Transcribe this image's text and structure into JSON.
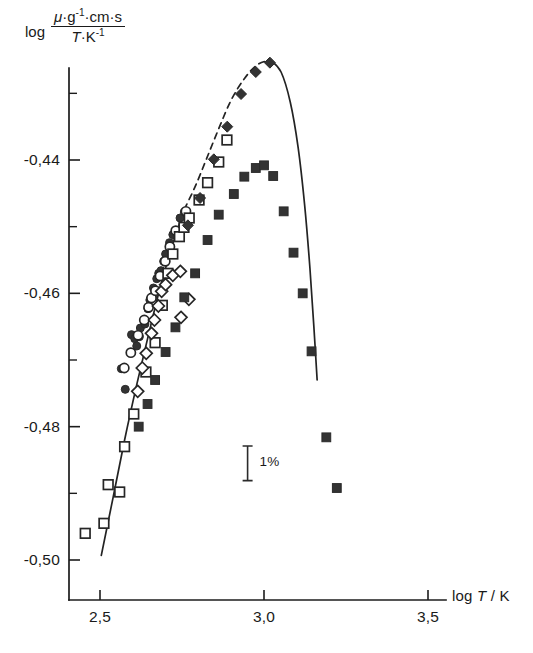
{
  "figure": {
    "name": "viscosity-log-plot",
    "background_color": "#ffffff",
    "ink_color": "#1a1a1a"
  },
  "axis_label_y": {
    "log_word": "log",
    "numerator_mu": "μ",
    "numerator_rest": "·g",
    "numerator_exp1": "-1",
    "numerator_tail": "·cm·s",
    "denominator_t": "T",
    "denominator_mid": "·K",
    "denominator_exp": "-1",
    "full_text": "log (μ·g⁻¹·cm·s / T·K⁻¹)"
  },
  "axis_label_x": {
    "prefix": "log ",
    "variable": "T",
    "suffix": " / K",
    "full_text": "log T / K"
  },
  "annotation": {
    "error_bar_label": "1%"
  },
  "chart_data": {
    "type": "scatter",
    "title": "",
    "xlabel": "log T / K",
    "ylabel": "log ( μ·g⁻¹·cm·s / T·K⁻¹ )",
    "xlim": [
      2.35,
      3.62
    ],
    "ylim": [
      -0.505,
      -0.425
    ],
    "grid": false,
    "legend": "none",
    "x_ticks_major": [
      2.5,
      3.0,
      3.5
    ],
    "x_tick_labels": [
      "2,5",
      "3,0",
      "3,5"
    ],
    "x_ticks_minor": [],
    "y_ticks_major": [
      -0.44,
      -0.46,
      -0.48,
      -0.5
    ],
    "y_tick_labels": [
      "-0,44",
      "-0,46",
      "-0,48",
      "-0,50"
    ],
    "y_ticks_minor": [
      -0.43,
      -0.45,
      -0.47,
      -0.49
    ],
    "decimal_separator": "comma",
    "annotations": [
      {
        "label": "1%",
        "type": "error-bar",
        "x": 2.95,
        "y_center": -0.4855,
        "y_half_height": 0.0026
      }
    ],
    "series": [
      {
        "name": "filled-circles",
        "marker": "filled-circle",
        "fill": "#333333",
        "points": [
          [
            2.565,
            -0.4713
          ],
          [
            2.577,
            -0.4744
          ],
          [
            2.596,
            -0.4662
          ],
          [
            2.606,
            -0.4668
          ],
          [
            2.612,
            -0.4679
          ],
          [
            2.62,
            -0.4665
          ],
          [
            2.623,
            -0.4652
          ],
          [
            2.637,
            -0.4646
          ],
          [
            2.646,
            -0.4623
          ],
          [
            2.652,
            -0.461
          ],
          [
            2.66,
            -0.4605
          ],
          [
            2.663,
            -0.4592
          ],
          [
            2.673,
            -0.4578
          ],
          [
            2.679,
            -0.457
          ],
          [
            2.686,
            -0.4566
          ],
          [
            2.694,
            -0.4552
          ],
          [
            2.7,
            -0.4541
          ],
          [
            2.712,
            -0.4524
          ],
          [
            2.722,
            -0.4512
          ],
          [
            2.744,
            -0.4487
          ],
          [
            2.757,
            -0.4478
          ]
        ]
      },
      {
        "name": "open-circles",
        "marker": "open-circle",
        "fill": "#ffffff",
        "points": [
          [
            2.574,
            -0.4712
          ],
          [
            2.594,
            -0.4689
          ],
          [
            2.616,
            -0.4663
          ],
          [
            2.635,
            -0.464
          ],
          [
            2.648,
            -0.4621
          ],
          [
            2.657,
            -0.4607
          ],
          [
            2.669,
            -0.4596
          ],
          [
            2.683,
            -0.4574
          ],
          [
            2.699,
            -0.4552
          ],
          [
            2.713,
            -0.453
          ],
          [
            2.731,
            -0.4506
          ],
          [
            2.762,
            -0.4477
          ]
        ]
      },
      {
        "name": "open-squares",
        "marker": "open-square",
        "fill": "#ffffff",
        "points": [
          [
            2.455,
            -0.496
          ],
          [
            2.512,
            -0.4945
          ],
          [
            2.525,
            -0.4887
          ],
          [
            2.56,
            -0.4898
          ],
          [
            2.575,
            -0.483
          ],
          [
            2.603,
            -0.4781
          ],
          [
            2.64,
            -0.4718
          ],
          [
            2.668,
            -0.4674
          ],
          [
            2.69,
            -0.4618
          ],
          [
            2.707,
            -0.457
          ],
          [
            2.722,
            -0.4541
          ],
          [
            2.742,
            -0.4515
          ],
          [
            2.756,
            -0.4501
          ],
          [
            2.772,
            -0.4487
          ],
          [
            2.802,
            -0.446
          ],
          [
            2.828,
            -0.4434
          ],
          [
            2.862,
            -0.4403
          ],
          [
            2.887,
            -0.437
          ]
        ]
      },
      {
        "name": "open-diamonds",
        "marker": "open-diamond",
        "fill": "#ffffff",
        "points": [
          [
            2.615,
            -0.4747
          ],
          [
            2.629,
            -0.4712
          ],
          [
            2.641,
            -0.469
          ],
          [
            2.657,
            -0.466
          ],
          [
            2.666,
            -0.464
          ],
          [
            2.678,
            -0.4619
          ],
          [
            2.688,
            -0.4597
          ],
          [
            2.7,
            -0.4587
          ],
          [
            2.722,
            -0.4573
          ],
          [
            2.745,
            -0.4567
          ],
          [
            2.771,
            -0.4609
          ],
          [
            2.747,
            -0.4636
          ]
        ]
      },
      {
        "name": "filled-squares",
        "marker": "filled-square",
        "fill": "#3b3b3b",
        "points": [
          [
            2.618,
            -0.48
          ],
          [
            2.645,
            -0.4766
          ],
          [
            2.668,
            -0.473
          ],
          [
            2.7,
            -0.4688
          ],
          [
            2.73,
            -0.4651
          ],
          [
            2.757,
            -0.4606
          ],
          [
            2.79,
            -0.457
          ],
          [
            2.828,
            -0.452
          ],
          [
            2.862,
            -0.4482
          ],
          [
            2.908,
            -0.4451
          ],
          [
            2.94,
            -0.4425
          ],
          [
            2.975,
            -0.4412
          ],
          [
            3.0,
            -0.4408
          ],
          [
            3.028,
            -0.4424
          ],
          [
            3.06,
            -0.4477
          ],
          [
            3.09,
            -0.4539
          ],
          [
            3.118,
            -0.46
          ],
          [
            3.145,
            -0.4687
          ],
          [
            3.19,
            -0.4816
          ],
          [
            3.222,
            -0.4892
          ]
        ]
      },
      {
        "name": "filled-diamonds",
        "marker": "filled-diamond",
        "fill": "#333333",
        "points": [
          [
            2.768,
            -0.4498
          ],
          [
            2.805,
            -0.4457
          ],
          [
            2.847,
            -0.4399
          ],
          [
            2.888,
            -0.435
          ],
          [
            2.93,
            -0.4301
          ],
          [
            2.975,
            -0.4268
          ],
          [
            3.018,
            -0.4254
          ]
        ]
      }
    ],
    "curves": [
      {
        "name": "fit-curve-solid-lower",
        "style": "solid",
        "color": "#232323",
        "points": [
          [
            2.504,
            -0.4993
          ],
          [
            2.54,
            -0.4906
          ],
          [
            2.575,
            -0.482
          ],
          [
            2.612,
            -0.4737
          ],
          [
            2.648,
            -0.4662
          ],
          [
            2.683,
            -0.4592
          ],
          [
            2.72,
            -0.4529
          ],
          [
            2.757,
            -0.4474
          ]
        ]
      },
      {
        "name": "fit-curve-dashed-peak",
        "style": "dashed",
        "color": "#232323",
        "points": [
          [
            2.757,
            -0.4474
          ],
          [
            2.79,
            -0.444
          ],
          [
            2.825,
            -0.4398
          ],
          [
            2.862,
            -0.4353
          ],
          [
            2.9,
            -0.431
          ],
          [
            2.94,
            -0.4278
          ],
          [
            2.98,
            -0.4257
          ],
          [
            3.02,
            -0.425
          ]
        ]
      },
      {
        "name": "fit-curve-solid-descent",
        "style": "solid",
        "color": "#232323",
        "points": [
          [
            3.02,
            -0.425
          ],
          [
            3.052,
            -0.4268
          ],
          [
            3.08,
            -0.4313
          ],
          [
            3.104,
            -0.4381
          ],
          [
            3.124,
            -0.4468
          ],
          [
            3.14,
            -0.4562
          ],
          [
            3.152,
            -0.465
          ],
          [
            3.162,
            -0.473
          ]
        ]
      }
    ]
  }
}
